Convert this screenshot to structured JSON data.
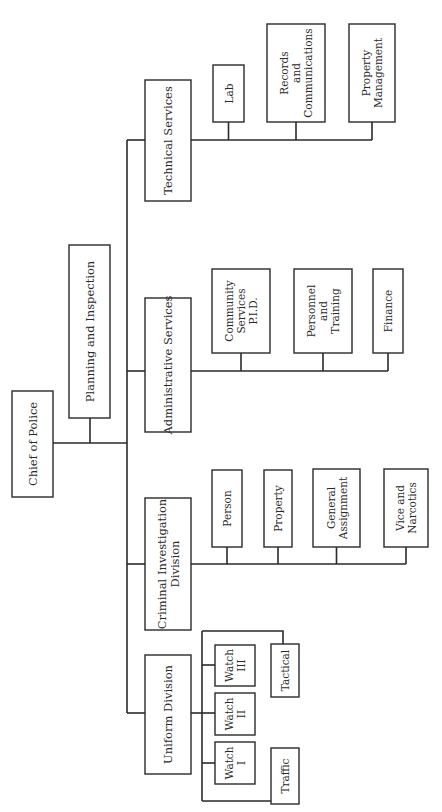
{
  "colors": {
    "line": "#2a2a2a",
    "background": "#ffffff"
  },
  "orientation": "rotated 90 degrees counter-clockwise",
  "root": {
    "label": [
      "Chief of Police"
    ]
  },
  "staff": {
    "label": [
      "Planning and Inspection"
    ]
  },
  "divisions": [
    {
      "id": "technical",
      "label": [
        "Technical Services"
      ],
      "units": [
        {
          "label": [
            "Lab"
          ]
        },
        {
          "label": [
            "Records",
            "and",
            "Communications"
          ]
        },
        {
          "label": [
            "Property",
            "Management"
          ]
        }
      ]
    },
    {
      "id": "administrative",
      "label": [
        "Administrative Services"
      ],
      "units": [
        {
          "label": [
            "Community",
            "Services",
            "P.I.D."
          ]
        },
        {
          "label": [
            "Personnel",
            "and",
            "Training"
          ]
        },
        {
          "label": [
            "Finance"
          ]
        }
      ]
    },
    {
      "id": "criminal",
      "label": [
        "Criminal Investigation",
        "Division"
      ],
      "units": [
        {
          "label": [
            "Person"
          ]
        },
        {
          "label": [
            "Property"
          ]
        },
        {
          "label": [
            "General",
            "Assignment"
          ]
        },
        {
          "label": [
            "Vice and",
            "Narcotics"
          ]
        }
      ]
    },
    {
      "id": "uniform",
      "label": [
        "Uniform Division"
      ],
      "units": [
        {
          "label": [
            "Watch",
            "I"
          ]
        },
        {
          "label": [
            "Watch",
            "II"
          ]
        },
        {
          "label": [
            "Watch",
            "III"
          ]
        },
        {
          "label": [
            "Traffic"
          ]
        },
        {
          "label": [
            "Tactical"
          ]
        }
      ]
    }
  ]
}
